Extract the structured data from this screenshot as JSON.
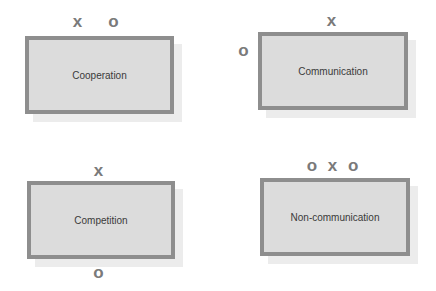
{
  "panels": [
    {
      "label": "Cooperation",
      "marks": {
        "top_left": "x",
        "top_right": "o"
      }
    },
    {
      "label": "Communication",
      "marks": {
        "top": "x",
        "left": "o"
      }
    },
    {
      "label": "Competition",
      "marks": {
        "top": "x",
        "bottom": "o"
      }
    },
    {
      "label": "Non-communication",
      "marks": {
        "top": "o x o"
      }
    }
  ],
  "colors": {
    "box_fill": "#dcdcdc",
    "box_border": "#8e8e8e",
    "mark": "#7a7a7a",
    "shadow": "#ececec"
  }
}
